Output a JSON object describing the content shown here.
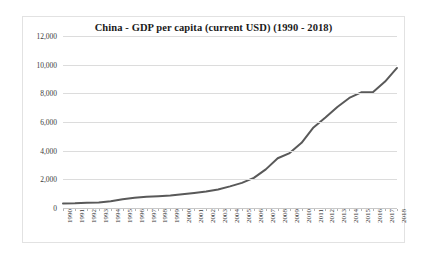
{
  "chart_data": {
    "type": "line",
    "title": "China - GDP per capita (current USD) (1990 - 2018)",
    "xlabel": "",
    "ylabel": "",
    "ylim": [
      0,
      12000
    ],
    "ytick_values": [
      0,
      2000,
      4000,
      6000,
      8000,
      10000,
      12000
    ],
    "ytick_labels": [
      "0",
      "2,000",
      "4,000",
      "6,000",
      "8,000",
      "10,000",
      "12,000"
    ],
    "grid": "horizontal",
    "legend": "none",
    "line_color": "#595959",
    "gridline_color": "#dcdcdc",
    "border_color": "#e2e2e2",
    "categories": [
      "1990",
      "1991",
      "1992",
      "1993",
      "1994",
      "1995",
      "1996",
      "1997",
      "1998",
      "1999",
      "2000",
      "2001",
      "2002",
      "2003",
      "2004",
      "2005",
      "2006",
      "2007",
      "2008",
      "2009",
      "2010",
      "2011",
      "2012",
      "2013",
      "2014",
      "2015",
      "2016",
      "2017",
      "2018"
    ],
    "values": [
      318,
      333,
      366,
      377,
      473,
      609,
      709,
      781,
      828,
      873,
      959,
      1053,
      1148,
      1288,
      1509,
      1753,
      2099,
      2694,
      3468,
      3832,
      4550,
      5618,
      6317,
      7051,
      7679,
      8067,
      8094,
      8817,
      9771
    ]
  }
}
